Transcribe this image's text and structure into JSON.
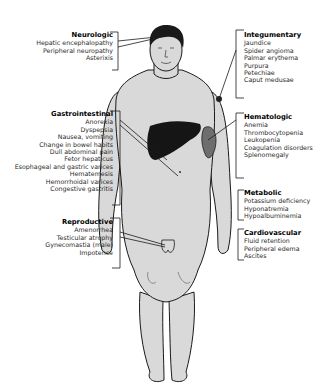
{
  "diagram": {
    "colors": {
      "skin": "#d9d9d9",
      "outline": "#1a1a1a",
      "liver": "#151515",
      "spleen": "#6e6e6e",
      "text": "#1a1a1a"
    }
  },
  "groups": {
    "neurologic": {
      "title": "Neurologic",
      "items": [
        "Hepatic encephalopathy",
        "Peripheral neuropathy",
        "Asterixis"
      ]
    },
    "integumentary": {
      "title": "Integumentary",
      "items": [
        "Jaundice",
        "Spider angioma",
        "Palmar erythema",
        "Purpura",
        "Petechiae",
        "Caput medusae"
      ]
    },
    "gastrointestinal": {
      "title": "Gastrointestinal",
      "items": [
        "Anorexia",
        "Dyspepsia",
        "Nausea, vomiting",
        "Change in bowel habits",
        "Dull abdominal pain",
        "Fetor hepaticus",
        "Esophageal and gastric varices",
        "Hematemesis",
        "Hemorrhoidal varices",
        "Congestive gastritis"
      ]
    },
    "hematologic": {
      "title": "Hematologic",
      "items": [
        "Anemia",
        "Thrombocytopenia",
        "Leukopenia",
        "Coagulation disorders",
        "Splenomegaly"
      ]
    },
    "metabolic": {
      "title": "Metabolic",
      "items": [
        "Potassium deficiency",
        "Hyponatremia",
        "Hypoalbuminemia"
      ]
    },
    "cardiovascular": {
      "title": "Cardiovascular",
      "items": [
        "Fluid retention",
        "Peripheral edema",
        "Ascites"
      ]
    },
    "reproductive": {
      "title": "Reproductive",
      "items": [
        "Amenorrhea",
        "Testicular atrophy",
        "Gynecomastia (male)",
        "Impotence"
      ]
    }
  }
}
